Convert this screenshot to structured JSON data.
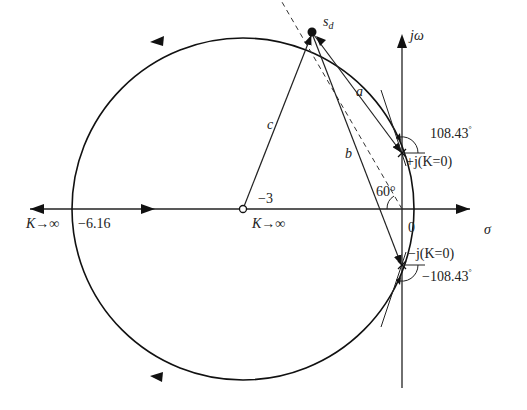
{
  "diagram": {
    "type": "root-locus",
    "axes": {
      "real_label": "σ",
      "imag_label": "jω",
      "origin_label": "0"
    },
    "points": {
      "sd_label": "s",
      "sd_subscript": "d",
      "zero_label": "−3",
      "pos_pole_label": "+j(K=0)",
      "neg_pole_label": "−j(K=0)",
      "breakaway_label": "−6.16",
      "k_inf_left": "K→∞",
      "k_inf_zero": "K→∞"
    },
    "vectors": {
      "a": "a",
      "b": "b",
      "c": "c"
    },
    "angles": {
      "upper_departure": "108.43",
      "lower_departure": "−108.43",
      "degree_sign": "°",
      "damping_angle": "60°"
    }
  }
}
